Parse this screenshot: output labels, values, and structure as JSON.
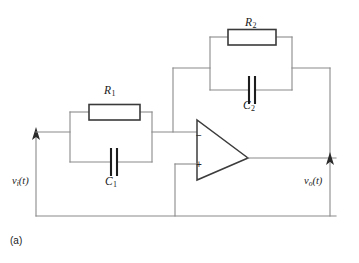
{
  "figure": {
    "caption": "(a)",
    "type": "op-amp active filter schematic"
  },
  "components": {
    "r1": {
      "label": "R",
      "subscript": "1",
      "name": "resistor-r1"
    },
    "c1": {
      "label": "C",
      "subscript": "1",
      "name": "capacitor-c1"
    },
    "r2": {
      "label": "R",
      "subscript": "2",
      "name": "resistor-r2"
    },
    "c2": {
      "label": "C",
      "subscript": "2",
      "name": "capacitor-c2"
    },
    "opamp": {
      "inverting_sign": "−",
      "noninverting_sign": "+",
      "name": "operational-amplifier"
    }
  },
  "signals": {
    "input": {
      "symbol": "v",
      "subscript": "i",
      "argument": "(t)"
    },
    "output": {
      "symbol": "v",
      "subscript": "o",
      "argument": "(t)"
    }
  },
  "colors": {
    "wire": "#8a8a8a",
    "wire_dark": "#585858",
    "component_outline": "#3a3a3a",
    "capacitor_plate": "#1d1d1d",
    "text": "#1a1a1a",
    "background": "#ffffff"
  }
}
